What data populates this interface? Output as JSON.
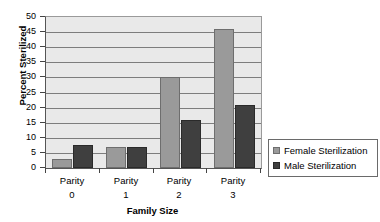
{
  "chart_data": {
    "type": "bar",
    "title": "States Wide - 1997",
    "xlabel": "Family Size",
    "ylabel": "Percent Sterilized",
    "categories": [
      "Parity 0",
      "Parity 1",
      "Parity 2",
      "Parity 3"
    ],
    "category_lines": [
      {
        "line1": "Parity",
        "line2": "0"
      },
      {
        "line1": "Parity",
        "line2": "1"
      },
      {
        "line1": "Parity",
        "line2": "2"
      },
      {
        "line1": "Parity",
        "line2": "3"
      }
    ],
    "series": [
      {
        "name": "Female Sterilization",
        "color": "#9a9a9a",
        "values": [
          3,
          7,
          30,
          46
        ]
      },
      {
        "name": "Male Sterilization",
        "color": "#3f3f3f",
        "values": [
          7.5,
          6.8,
          16,
          21
        ]
      }
    ],
    "ylim": [
      0,
      50
    ],
    "ytick_step": 5,
    "yticks": [
      0,
      5,
      10,
      15,
      20,
      25,
      30,
      35,
      40,
      45,
      50
    ],
    "grid": true,
    "legend_position": "right",
    "plot_background": "#e9e9e9",
    "gridline_color": "#7d7d7d"
  }
}
